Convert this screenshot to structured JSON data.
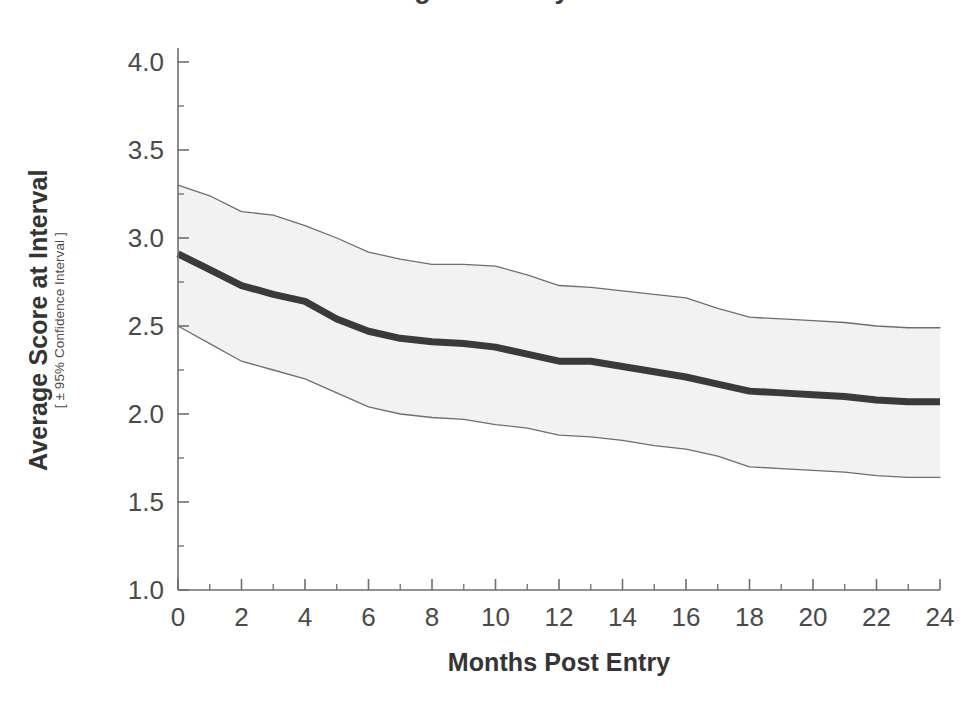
{
  "chart_data": {
    "type": "line",
    "title": "Average Score by Time",
    "xlabel": "Months Post Entry",
    "ylabel": "Average Score at Interval",
    "ylabel_sub": "[ ± 95% Confidence Interval ]",
    "xlim": [
      0,
      24
    ],
    "ylim": [
      1.0,
      4.0
    ],
    "xticks": [
      0,
      2,
      4,
      6,
      8,
      10,
      12,
      14,
      16,
      18,
      20,
      22,
      24
    ],
    "xtick_labels": [
      "0",
      "2",
      "4",
      "6",
      "8",
      "10",
      "12",
      "14",
      "16",
      "18",
      "20",
      "22",
      "24"
    ],
    "yticks": [
      1.0,
      1.5,
      2.0,
      2.5,
      3.0,
      3.5,
      4.0
    ],
    "ytick_labels": [
      "1.0",
      "1.5",
      "2.0",
      "2.5",
      "3.0",
      "3.5",
      "4.0"
    ],
    "minor_xticks": [
      1,
      3,
      5,
      7,
      9,
      11,
      13,
      15,
      17,
      19,
      21,
      23
    ],
    "minor_yticks": [
      1.25,
      1.75,
      2.25,
      2.75,
      3.25,
      3.75
    ],
    "grid": false,
    "legend": null,
    "x": [
      0,
      1,
      2,
      3,
      4,
      5,
      6,
      7,
      8,
      9,
      10,
      11,
      12,
      13,
      14,
      15,
      16,
      17,
      18,
      19,
      20,
      21,
      22,
      23,
      24
    ],
    "series": [
      {
        "name": "Average Score",
        "role": "mean",
        "color": "#3a3a3a",
        "linewidth": 7,
        "values": [
          2.91,
          2.82,
          2.73,
          2.68,
          2.64,
          2.54,
          2.47,
          2.43,
          2.41,
          2.4,
          2.38,
          2.34,
          2.3,
          2.3,
          2.27,
          2.24,
          2.21,
          2.17,
          2.13,
          2.12,
          2.11,
          2.1,
          2.08,
          2.07,
          2.07
        ]
      },
      {
        "name": "Upper 95% Confidence Limit",
        "role": "ci_upper",
        "color": "#6e6e6e",
        "linewidth": 1.3,
        "values": [
          3.3,
          3.24,
          3.15,
          3.13,
          3.07,
          3.0,
          2.92,
          2.88,
          2.85,
          2.85,
          2.84,
          2.79,
          2.73,
          2.72,
          2.7,
          2.68,
          2.66,
          2.6,
          2.55,
          2.54,
          2.53,
          2.52,
          2.5,
          2.49,
          2.49
        ]
      },
      {
        "name": "Lower 95% Confidence Limit",
        "role": "ci_lower",
        "color": "#6e6e6e",
        "linewidth": 1.3,
        "values": [
          2.5,
          2.4,
          2.3,
          2.25,
          2.2,
          2.12,
          2.04,
          2.0,
          1.98,
          1.97,
          1.94,
          1.92,
          1.88,
          1.87,
          1.85,
          1.82,
          1.8,
          1.76,
          1.7,
          1.69,
          1.68,
          1.67,
          1.65,
          1.64,
          1.64
        ]
      }
    ],
    "band": {
      "name": "95% Confidence Band",
      "fill": "#f2f2f2"
    },
    "colors": {
      "axis": "#6e6e6e",
      "text": "#3a3a3a",
      "mean_line": "#3a3a3a",
      "ci_line": "#6e6e6e",
      "band_fill": "#f2f2f2",
      "background": "#ffffff"
    }
  }
}
